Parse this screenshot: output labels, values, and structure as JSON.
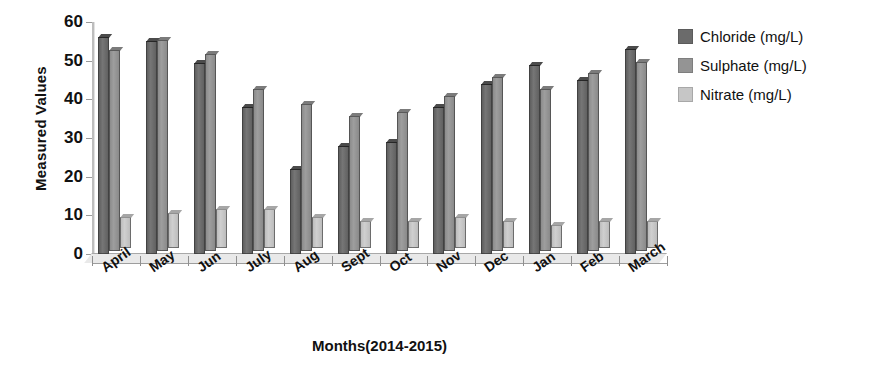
{
  "chart_data": {
    "type": "bar",
    "title": "",
    "xlabel": "Months(2014-2015)",
    "ylabel": "Measured Values",
    "ylim": [
      0,
      60
    ],
    "yticks": [
      0,
      10,
      20,
      30,
      40,
      50,
      60
    ],
    "grid": false,
    "legend_position": "right",
    "categories": [
      "April",
      "May",
      "Jun",
      "July",
      "Aug",
      "Sept",
      "Oct",
      "Nov",
      "Dec",
      "Jan",
      "Feb",
      "March"
    ],
    "series": [
      {
        "name": "Chloride (mg/L)",
        "color": "#6b6b6b",
        "values": [
          56,
          55,
          49.5,
          38,
          22,
          28,
          29,
          38,
          44,
          49,
          45,
          53
        ]
      },
      {
        "name": "Sulphate (mg/L)",
        "color": "#949494",
        "values": [
          52,
          54.5,
          51,
          42,
          38,
          35,
          36,
          40,
          45,
          42,
          46,
          49
        ]
      },
      {
        "name": "Nitrate (mg/L)",
        "color": "#c6c6c6",
        "values": [
          8,
          9,
          10,
          10,
          8,
          7,
          7,
          8,
          7,
          6,
          7,
          7
        ]
      }
    ],
    "series_secondary_nitrate_front": [
      6,
      6,
      6,
      6.5,
      6,
      5.5,
      5.5,
      5,
      5,
      5,
      6,
      6
    ]
  },
  "axis": {
    "y_title": "Measured Values",
    "x_title": "Months(2014-2015)",
    "y_tick_labels": [
      "60",
      "50",
      "40",
      "30",
      "20",
      "10",
      "0"
    ]
  },
  "legend": {
    "items": [
      {
        "label": "Chloride (mg/L)",
        "color": "#6b6b6b"
      },
      {
        "label": "Sulphate (mg/L)",
        "color": "#949494"
      },
      {
        "label": "Nitrate (mg/L)",
        "color": "#c6c6c6"
      }
    ]
  }
}
